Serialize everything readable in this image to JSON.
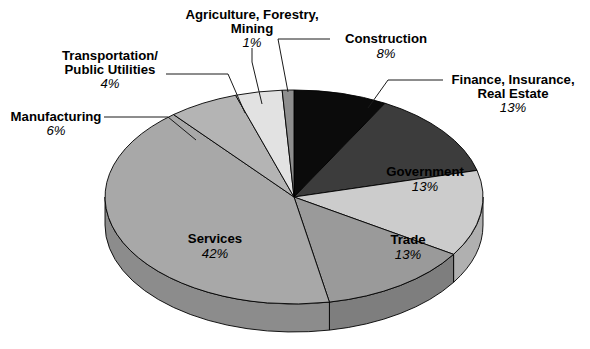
{
  "chart_data": {
    "type": "pie",
    "title": "",
    "subtitle": "",
    "xlabel": "",
    "ylabel": "",
    "legend_position": "none",
    "grid": false,
    "style": "3d-pie",
    "start_angle_deg": 0,
    "direction": "clockwise",
    "categories": [
      "Construction",
      "Finance, Insurance, Real Estate",
      "Government",
      "Trade",
      "Services",
      "Manufacturing",
      "Transportation/Public Utilities",
      "Agriculture, Forestry, Mining"
    ],
    "values": [
      8,
      13,
      13,
      13,
      42,
      6,
      4,
      1
    ],
    "value_labels": [
      "8%",
      "13%",
      "13%",
      "13%",
      "42%",
      "6%",
      "4%",
      "1%"
    ],
    "colors": [
      "#0b0b0b",
      "#3c3c3c",
      "#cccccc",
      "#9a9a9a",
      "#a8a8a8",
      "#b4b4b4",
      "#e2e2e2",
      "#8e8e8e"
    ],
    "slices": [
      {
        "name": "construction",
        "label": "Construction",
        "percent_label": "8%",
        "value": 8,
        "color": "#0b0b0b",
        "side_color": "#050505",
        "label_placement": "outside",
        "label_lines": [
          "Construction"
        ]
      },
      {
        "name": "finance-insurance-real-estate",
        "label": "Finance, Insurance, Real Estate",
        "percent_label": "13%",
        "value": 13,
        "color": "#3c3c3c",
        "side_color": "#2a2a2a",
        "label_placement": "outside",
        "label_lines": [
          "Finance, Insurance,",
          "Real Estate"
        ]
      },
      {
        "name": "government",
        "label": "Government",
        "percent_label": "13%",
        "value": 13,
        "color": "#cccccc",
        "side_color": "#b0b0b0",
        "label_placement": "inside",
        "label_lines": [
          "Government"
        ]
      },
      {
        "name": "trade",
        "label": "Trade",
        "percent_label": "13%",
        "value": 13,
        "color": "#9a9a9a",
        "side_color": "#7e7e7e",
        "label_placement": "inside",
        "label_lines": [
          "Trade"
        ]
      },
      {
        "name": "services",
        "label": "Services",
        "percent_label": "42%",
        "value": 42,
        "color": "#a8a8a8",
        "side_color": "#8c8c8c",
        "label_placement": "inside",
        "label_lines": [
          "Services"
        ]
      },
      {
        "name": "manufacturing",
        "label": "Manufacturing",
        "percent_label": "6%",
        "value": 6,
        "color": "#b4b4b4",
        "side_color": "#989898",
        "label_placement": "outside",
        "label_lines": [
          "Manufacturing"
        ]
      },
      {
        "name": "transportation-public-utilities",
        "label": "Transportation/Public Utilities",
        "percent_label": "4%",
        "value": 4,
        "color": "#e2e2e2",
        "side_color": "#c6c6c6",
        "label_placement": "outside",
        "label_lines": [
          "Transportation/",
          "Public Utilities"
        ]
      },
      {
        "name": "agriculture-forestry-mining",
        "label": "Agriculture, Forestry, Mining",
        "percent_label": "1%",
        "value": 1,
        "color": "#8e8e8e",
        "side_color": "#747474",
        "label_placement": "outside",
        "label_lines": [
          "Agriculture, Forestry,",
          "Mining"
        ]
      }
    ]
  },
  "labels": {
    "agriculture": {
      "line1": "Agriculture, Forestry,",
      "line2": "Mining",
      "percent": "1%"
    },
    "transportation": {
      "line1": "Transportation/",
      "line2": "Public Utilities",
      "percent": "4%"
    },
    "manufacturing": {
      "line1": "Manufacturing",
      "percent": "6%"
    },
    "construction": {
      "line1": "Construction",
      "percent": "8%"
    },
    "finance": {
      "line1": "Finance, Insurance,",
      "line2": "Real Estate",
      "percent": "13%"
    },
    "government": {
      "line1": "Government",
      "percent": "13%"
    },
    "trade": {
      "line1": "Trade",
      "percent": "13%"
    },
    "services": {
      "line1": "Services",
      "percent": "42%"
    }
  }
}
